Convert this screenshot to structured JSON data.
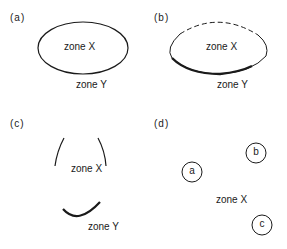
{
  "panels": {
    "a": {
      "label": "(a)",
      "inner": "zone X",
      "outer": "zone Y"
    },
    "b": {
      "label": "(b)",
      "inner": "zone X",
      "outer": "zone Y"
    },
    "c": {
      "label": "(c)",
      "inner": "zone X",
      "outer": "zone Y"
    },
    "d": {
      "label": "(d)",
      "zone": "zone X",
      "circles": [
        "a",
        "b",
        "c"
      ]
    }
  }
}
